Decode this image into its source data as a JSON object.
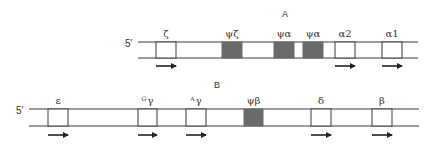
{
  "diagram": {
    "colors": {
      "line": "#3a3a3a",
      "pseudogene_fill": "#6a6a6a",
      "gene_fill": "#ffffff",
      "arrow": "#222222"
    },
    "rows": [
      {
        "section_label": "A",
        "section_label_x": 282,
        "section_label_y": 17,
        "five_prime_label": "5′",
        "five_prime_x": 125,
        "line_start": 138,
        "line_end": 418,
        "top_y": 42,
        "bottom_y": 58,
        "label_y": 37,
        "arrow_y": 66,
        "genes": [
          {
            "label": "ζ",
            "sup": "",
            "x": 156,
            "w": 20,
            "pseudo": false,
            "arrow": true
          },
          {
            "label": "ψζ",
            "sup": "",
            "x": 222,
            "w": 20,
            "pseudo": true,
            "arrow": false
          },
          {
            "label": "ψα",
            "sup": "",
            "x": 274,
            "w": 20,
            "pseudo": true,
            "arrow": false
          },
          {
            "label": "ψα",
            "sup": "",
            "x": 303,
            "w": 20,
            "pseudo": true,
            "arrow": false
          },
          {
            "label": "α2",
            "sup": "",
            "x": 335,
            "w": 20,
            "pseudo": false,
            "arrow": true
          },
          {
            "label": "α1",
            "sup": "",
            "x": 382,
            "w": 20,
            "pseudo": false,
            "arrow": true
          }
        ]
      },
      {
        "section_label": "B",
        "section_label_x": 214,
        "section_label_y": 88,
        "five_prime_label": "5′",
        "five_prime_x": 16,
        "line_start": 29,
        "line_end": 419,
        "top_y": 109,
        "bottom_y": 126,
        "label_y": 104,
        "arrow_y": 135,
        "genes": [
          {
            "label": "ε",
            "sup": "",
            "x": 48,
            "w": 20,
            "pseudo": false,
            "arrow": true
          },
          {
            "label": "γ",
            "sup": "G",
            "x": 138,
            "w": 19,
            "pseudo": false,
            "arrow": true
          },
          {
            "label": "γ",
            "sup": "A",
            "x": 186,
            "w": 20,
            "pseudo": false,
            "arrow": true
          },
          {
            "label": "ψβ",
            "sup": "",
            "x": 244,
            "w": 19,
            "pseudo": true,
            "arrow": false
          },
          {
            "label": "δ",
            "sup": "",
            "x": 311,
            "w": 20,
            "pseudo": false,
            "arrow": true
          },
          {
            "label": "β",
            "sup": "",
            "x": 372,
            "w": 20,
            "pseudo": false,
            "arrow": true
          }
        ]
      }
    ]
  }
}
